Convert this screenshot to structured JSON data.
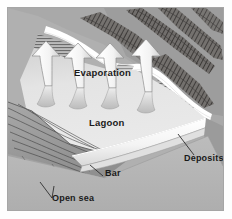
{
  "figure": {
    "kind": "geological-cross-section-diagram",
    "background_color": "#b9b9b9",
    "frame_border_color": "#a6a6a6",
    "page_color": "#fefefe"
  },
  "labels": {
    "evaporation": "Evaporation",
    "lagoon": "Lagoon",
    "deposits": "Deposits",
    "bar": "Bar",
    "open_sea": "Open sea"
  },
  "colors": {
    "lagoon_water": "#e3e3e3",
    "sky_upland": "#b0b0b0",
    "ridge_dark": "#4a4744",
    "ridge_mid": "#7d7a77",
    "arrow_fill": "#f7f7f7",
    "arrow_outline": "#8e8e8e",
    "bar_fill": "#fbfbfb",
    "foreground": "#b3b3b3",
    "slope_shadow": "#9a9a9a",
    "leader_line": "#3a3a3a",
    "text": "#1a1a1a"
  },
  "elements": {
    "arrow_count": 4,
    "arrow_direction": "up",
    "arrow_meaning": "evaporation from lagoon surface",
    "bar_description": "light elongated wedge separating lagoon from open sea",
    "shoreline_description": "white highlighted shoreline along upland ridges"
  }
}
